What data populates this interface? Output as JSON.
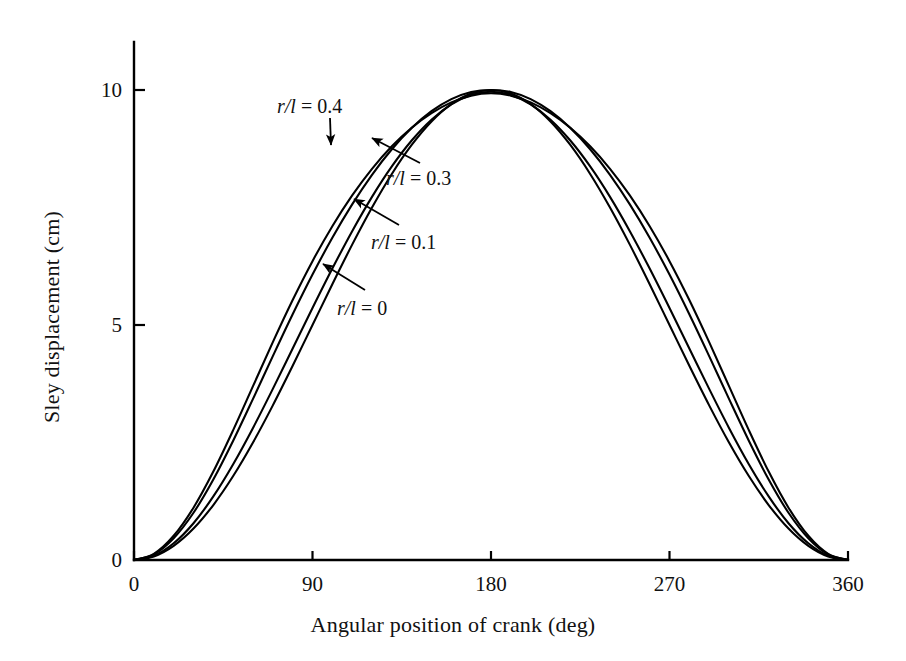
{
  "chart_data": {
    "type": "line",
    "title": "",
    "xlabel": "Angular position of crank (deg)",
    "ylabel": "Sley displacement (cm)",
    "xlim": [
      0,
      360
    ],
    "ylim": [
      0,
      11
    ],
    "xticks": [
      0,
      90,
      180,
      270,
      360
    ],
    "xtick_labels": [
      "0",
      "90",
      "180",
      "270",
      "360"
    ],
    "yticks": [
      0,
      5,
      10
    ],
    "ytick_labels": [
      "0",
      "5",
      "10"
    ],
    "grid": false,
    "legend": "inline-annotations",
    "x": [
      0,
      10,
      20,
      30,
      40,
      50,
      60,
      70,
      80,
      90,
      100,
      110,
      120,
      130,
      140,
      150,
      160,
      170,
      180,
      190,
      200,
      210,
      220,
      230,
      240,
      250,
      260,
      270,
      280,
      290,
      300,
      310,
      320,
      330,
      340,
      350,
      360
    ],
    "series": [
      {
        "name": "r/l = 0",
        "label": "r/l = 0",
        "ratio": 0,
        "color": "#000000",
        "values": [
          0.0,
          0.076,
          0.302,
          0.67,
          1.17,
          1.786,
          2.5,
          3.29,
          4.132,
          5.0,
          5.868,
          6.71,
          7.5,
          8.214,
          8.83,
          9.33,
          9.698,
          9.924,
          10.0,
          9.924,
          9.698,
          9.33,
          8.83,
          8.214,
          7.5,
          6.71,
          5.868,
          5.0,
          4.132,
          3.29,
          2.5,
          1.786,
          1.17,
          0.67,
          0.302,
          0.076,
          0.0
        ]
      },
      {
        "name": "r/l = 0.1",
        "label": "r/l = 0.1",
        "ratio": 0.1,
        "color": "#000000",
        "values": [
          0.0,
          0.09,
          0.356,
          0.783,
          1.353,
          2.038,
          2.81,
          3.641,
          4.501,
          5.362,
          6.201,
          6.996,
          7.726,
          8.374,
          8.925,
          9.368,
          9.693,
          9.894,
          9.962,
          9.894,
          9.693,
          9.368,
          8.925,
          8.374,
          7.726,
          6.996,
          6.201,
          5.362,
          4.501,
          3.641,
          2.81,
          2.038,
          1.353,
          0.783,
          0.356,
          0.09,
          0.0
        ]
      },
      {
        "name": "r/l = 0.3",
        "label": "r/l = 0.3",
        "ratio": 0.3,
        "color": "#000000",
        "values": [
          0.0,
          0.117,
          0.462,
          1.005,
          1.713,
          2.538,
          3.428,
          4.337,
          5.228,
          6.073,
          6.856,
          7.566,
          8.196,
          8.74,
          9.192,
          9.549,
          9.806,
          9.958,
          10.0,
          9.958,
          9.806,
          9.549,
          9.192,
          8.74,
          8.196,
          7.566,
          6.856,
          6.073,
          5.228,
          4.337,
          3.428,
          2.538,
          1.713,
          1.005,
          0.462,
          0.117,
          0.0
        ]
      },
      {
        "name": "r/l = 0.4",
        "label": "r/l = 0.4",
        "ratio": 0.4,
        "color": "#000000",
        "values": [
          0.0,
          0.131,
          0.515,
          1.113,
          1.881,
          2.763,
          3.699,
          4.636,
          5.532,
          6.359,
          7.102,
          7.757,
          8.323,
          8.802,
          9.196,
          9.508,
          9.737,
          9.88,
          9.93,
          9.88,
          9.737,
          9.508,
          9.196,
          8.802,
          8.323,
          7.757,
          7.102,
          6.359,
          5.532,
          4.636,
          3.699,
          2.763,
          1.881,
          1.113,
          0.515,
          0.131,
          0.0
        ]
      }
    ],
    "annotations": [
      {
        "id": "ann-04",
        "text": "r/l = 0.4",
        "symbol_prefix": "r/l",
        "value_text": "= 0.4",
        "label_x": 277,
        "label_y": 96,
        "arrow_from_x": 330,
        "arrow_from_y": 118,
        "arrow_to_x": 331,
        "arrow_to_y": 145
      },
      {
        "id": "ann-03",
        "text": "r/l = 0.3",
        "symbol_prefix": "r/l",
        "value_text": "= 0.3",
        "label_x": 386,
        "label_y": 168,
        "arrow_from_x": 420,
        "arrow_from_y": 163,
        "arrow_to_x": 372,
        "arrow_to_y": 138
      },
      {
        "id": "ann-01",
        "text": "r/l = 0.1",
        "symbol_prefix": "r/l",
        "value_text": "= 0.1",
        "label_x": 371,
        "label_y": 232,
        "arrow_from_x": 399,
        "arrow_from_y": 225,
        "arrow_to_x": 354,
        "arrow_to_y": 199
      },
      {
        "id": "ann-00",
        "text": "r/l = 0",
        "symbol_prefix": "r/l",
        "value_text": "= 0",
        "label_x": 337,
        "label_y": 298,
        "arrow_from_x": 365,
        "arrow_from_y": 290,
        "arrow_to_x": 323,
        "arrow_to_y": 264
      }
    ]
  },
  "axes": {
    "x_title": "Angular position of crank (deg)",
    "y_title": "Sley displacement (cm)"
  }
}
